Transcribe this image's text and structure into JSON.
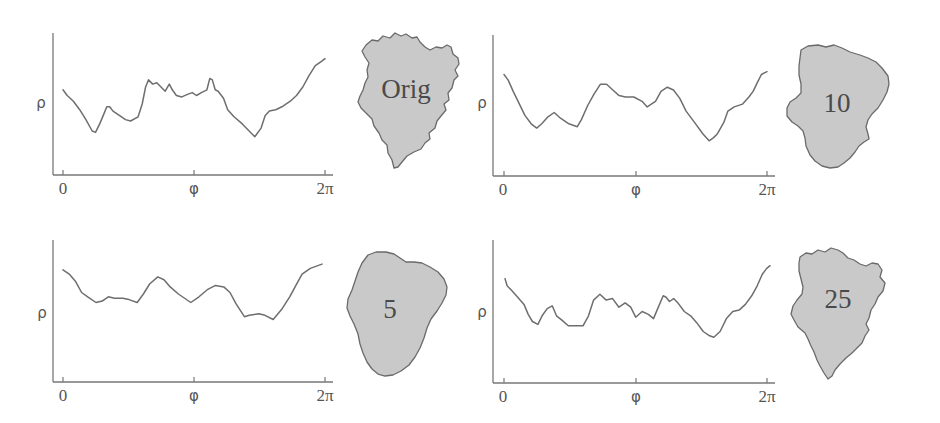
{
  "figure": {
    "x_tick_labels": [
      "0",
      "φ",
      "2π"
    ],
    "y_axis_label": "ρ",
    "panels": [
      {
        "id": "orig",
        "label": "Orig"
      },
      {
        "id": "h10",
        "label": "10"
      },
      {
        "id": "h5",
        "label": "5"
      },
      {
        "id": "h25",
        "label": "25"
      }
    ],
    "colors": {
      "axis": "#777777",
      "curve": "#6e6e6e",
      "blob_fill": "#c9c9c9",
      "blob_stroke": "#6a6a6a",
      "text": "#555555"
    }
  },
  "chart_data": [
    {
      "type": "line",
      "title": "Orig",
      "xlabel": "φ",
      "ylabel": "ρ",
      "x_range": [
        0,
        6.283
      ],
      "x_ticks": [
        "0",
        "φ",
        "2π"
      ],
      "grid": false,
      "note": "x in radians (0..2π); y normalized 0 (axis bottom) .. 1 (axis top)",
      "points": [
        [
          0,
          0.6
        ],
        [
          0.1,
          0.56
        ],
        [
          0.25,
          0.52
        ],
        [
          0.4,
          0.46
        ],
        [
          0.55,
          0.39
        ],
        [
          0.7,
          0.31
        ],
        [
          0.78,
          0.3
        ],
        [
          0.88,
          0.36
        ],
        [
          0.98,
          0.43
        ],
        [
          1.05,
          0.48
        ],
        [
          1.12,
          0.48
        ],
        [
          1.2,
          0.45
        ],
        [
          1.35,
          0.42
        ],
        [
          1.5,
          0.39
        ],
        [
          1.62,
          0.38
        ],
        [
          1.8,
          0.41
        ],
        [
          1.9,
          0.5
        ],
        [
          1.98,
          0.62
        ],
        [
          2.05,
          0.67
        ],
        [
          2.15,
          0.64
        ],
        [
          2.25,
          0.65
        ],
        [
          2.35,
          0.62
        ],
        [
          2.45,
          0.59
        ],
        [
          2.55,
          0.64
        ],
        [
          2.62,
          0.6
        ],
        [
          2.72,
          0.56
        ],
        [
          2.85,
          0.55
        ],
        [
          3.0,
          0.57
        ],
        [
          3.1,
          0.58
        ],
        [
          3.2,
          0.56
        ],
        [
          3.32,
          0.58
        ],
        [
          3.45,
          0.6
        ],
        [
          3.52,
          0.68
        ],
        [
          3.58,
          0.67
        ],
        [
          3.65,
          0.6
        ],
        [
          3.72,
          0.59
        ],
        [
          3.85,
          0.54
        ],
        [
          3.95,
          0.46
        ],
        [
          4.1,
          0.41
        ],
        [
          4.3,
          0.36
        ],
        [
          4.5,
          0.3
        ],
        [
          4.6,
          0.27
        ],
        [
          4.75,
          0.33
        ],
        [
          4.85,
          0.42
        ],
        [
          4.95,
          0.45
        ],
        [
          5.1,
          0.46
        ],
        [
          5.25,
          0.48
        ],
        [
          5.45,
          0.52
        ],
        [
          5.6,
          0.56
        ],
        [
          5.75,
          0.62
        ],
        [
          5.9,
          0.7
        ],
        [
          6.05,
          0.77
        ],
        [
          6.2,
          0.8
        ],
        [
          6.283,
          0.82
        ]
      ]
    },
    {
      "type": "line",
      "title": "10",
      "xlabel": "φ",
      "ylabel": "ρ",
      "x_range": [
        0,
        6.283
      ],
      "x_ticks": [
        "0",
        "φ",
        "2π"
      ],
      "grid": false,
      "points": [
        [
          0,
          0.72
        ],
        [
          0.1,
          0.68
        ],
        [
          0.22,
          0.6
        ],
        [
          0.35,
          0.52
        ],
        [
          0.5,
          0.43
        ],
        [
          0.65,
          0.37
        ],
        [
          0.78,
          0.34
        ],
        [
          0.9,
          0.37
        ],
        [
          1.05,
          0.42
        ],
        [
          1.2,
          0.45
        ],
        [
          1.35,
          0.41
        ],
        [
          1.55,
          0.37
        ],
        [
          1.75,
          0.35
        ],
        [
          1.85,
          0.4
        ],
        [
          2.0,
          0.5
        ],
        [
          2.15,
          0.58
        ],
        [
          2.3,
          0.65
        ],
        [
          2.45,
          0.65
        ],
        [
          2.6,
          0.61
        ],
        [
          2.75,
          0.57
        ],
        [
          2.9,
          0.56
        ],
        [
          3.1,
          0.56
        ],
        [
          3.3,
          0.53
        ],
        [
          3.42,
          0.49
        ],
        [
          3.52,
          0.51
        ],
        [
          3.62,
          0.53
        ],
        [
          3.75,
          0.6
        ],
        [
          3.9,
          0.63
        ],
        [
          4.05,
          0.61
        ],
        [
          4.2,
          0.55
        ],
        [
          4.35,
          0.46
        ],
        [
          4.55,
          0.38
        ],
        [
          4.75,
          0.3
        ],
        [
          4.9,
          0.25
        ],
        [
          5.0,
          0.27
        ],
        [
          5.1,
          0.3
        ],
        [
          5.25,
          0.38
        ],
        [
          5.35,
          0.46
        ],
        [
          5.5,
          0.49
        ],
        [
          5.7,
          0.51
        ],
        [
          5.85,
          0.56
        ],
        [
          5.95,
          0.6
        ],
        [
          6.05,
          0.66
        ],
        [
          6.15,
          0.72
        ],
        [
          6.283,
          0.74
        ]
      ]
    },
    {
      "type": "line",
      "title": "5",
      "xlabel": "φ",
      "ylabel": "ρ",
      "x_range": [
        0,
        6.283
      ],
      "x_ticks": [
        "0",
        "φ",
        "2π"
      ],
      "grid": false,
      "points": [
        [
          0,
          0.79
        ],
        [
          0.15,
          0.76
        ],
        [
          0.3,
          0.71
        ],
        [
          0.45,
          0.63
        ],
        [
          0.6,
          0.6
        ],
        [
          0.8,
          0.56
        ],
        [
          0.95,
          0.57
        ],
        [
          1.1,
          0.6
        ],
        [
          1.25,
          0.59
        ],
        [
          1.45,
          0.59
        ],
        [
          1.6,
          0.58
        ],
        [
          1.8,
          0.56
        ],
        [
          1.95,
          0.62
        ],
        [
          2.1,
          0.69
        ],
        [
          2.3,
          0.74
        ],
        [
          2.45,
          0.72
        ],
        [
          2.6,
          0.67
        ],
        [
          2.8,
          0.62
        ],
        [
          3.1,
          0.56
        ],
        [
          3.3,
          0.6
        ],
        [
          3.5,
          0.65
        ],
        [
          3.7,
          0.68
        ],
        [
          3.9,
          0.67
        ],
        [
          4.05,
          0.63
        ],
        [
          4.2,
          0.55
        ],
        [
          4.4,
          0.46
        ],
        [
          4.52,
          0.47
        ],
        [
          4.75,
          0.48
        ],
        [
          4.9,
          0.47
        ],
        [
          5.1,
          0.44
        ],
        [
          5.3,
          0.51
        ],
        [
          5.5,
          0.6
        ],
        [
          5.65,
          0.68
        ],
        [
          5.8,
          0.76
        ],
        [
          6.0,
          0.8
        ],
        [
          6.283,
          0.83
        ]
      ]
    },
    {
      "type": "line",
      "title": "25",
      "xlabel": "φ",
      "ylabel": "ρ",
      "x_range": [
        0,
        6.283
      ],
      "x_ticks": [
        "0",
        "φ",
        "2π"
      ],
      "grid": false,
      "points": [
        [
          0,
          0.73
        ],
        [
          0.05,
          0.68
        ],
        [
          0.15,
          0.65
        ],
        [
          0.3,
          0.6
        ],
        [
          0.45,
          0.55
        ],
        [
          0.55,
          0.48
        ],
        [
          0.65,
          0.43
        ],
        [
          0.78,
          0.41
        ],
        [
          0.88,
          0.47
        ],
        [
          1.0,
          0.52
        ],
        [
          1.12,
          0.54
        ],
        [
          1.22,
          0.47
        ],
        [
          1.35,
          0.44
        ],
        [
          1.5,
          0.4
        ],
        [
          1.65,
          0.4
        ],
        [
          1.85,
          0.4
        ],
        [
          1.98,
          0.47
        ],
        [
          2.1,
          0.58
        ],
        [
          2.25,
          0.62
        ],
        [
          2.4,
          0.58
        ],
        [
          2.55,
          0.59
        ],
        [
          2.7,
          0.53
        ],
        [
          2.85,
          0.56
        ],
        [
          2.98,
          0.53
        ],
        [
          3.1,
          0.46
        ],
        [
          3.25,
          0.5
        ],
        [
          3.4,
          0.48
        ],
        [
          3.52,
          0.45
        ],
        [
          3.62,
          0.52
        ],
        [
          3.75,
          0.61
        ],
        [
          3.82,
          0.6
        ],
        [
          3.9,
          0.57
        ],
        [
          4.0,
          0.59
        ],
        [
          4.1,
          0.56
        ],
        [
          4.25,
          0.5
        ],
        [
          4.4,
          0.47
        ],
        [
          4.55,
          0.42
        ],
        [
          4.7,
          0.36
        ],
        [
          4.85,
          0.33
        ],
        [
          4.95,
          0.32
        ],
        [
          5.1,
          0.36
        ],
        [
          5.25,
          0.45
        ],
        [
          5.4,
          0.5
        ],
        [
          5.55,
          0.51
        ],
        [
          5.7,
          0.55
        ],
        [
          5.85,
          0.61
        ],
        [
          5.98,
          0.68
        ],
        [
          6.1,
          0.76
        ],
        [
          6.2,
          0.8
        ],
        [
          6.283,
          0.82
        ]
      ]
    }
  ]
}
